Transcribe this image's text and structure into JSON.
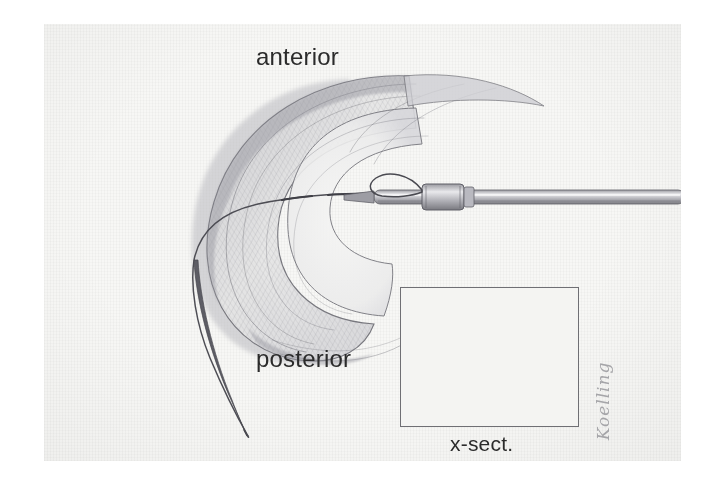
{
  "figure": {
    "kind": "pencil medical illustration",
    "background_color": "#f7f7f5",
    "ink_color": "#4a4a50"
  },
  "labels": {
    "anterior": "anterior",
    "posterior": "posterior",
    "cross_section": "x-sect."
  },
  "signature": {
    "text": "Koelling",
    "orientation": "vertical",
    "color": "#8d8d92"
  },
  "inset": {
    "title": "x-sect.",
    "border_color": "#6f6f74",
    "contents": [
      "femoral condyle",
      "meniscus wedge",
      "tibial plateau",
      "suture needle path"
    ]
  },
  "instruments": {
    "cannula": "suture delivery cannula",
    "needle_loop": "needle loop tip",
    "suture": "curved suture thread"
  }
}
